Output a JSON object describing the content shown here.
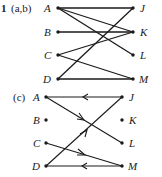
{
  "problem_number": "1",
  "diagram_ab": {
    "part_label": "(a,b)",
    "left_nodes": [
      "A",
      "B",
      "C",
      "D"
    ],
    "right_nodes": [
      "J",
      "K",
      "L",
      "M"
    ],
    "edges": [
      [
        "A",
        "J"
      ],
      [
        "A",
        "K"
      ],
      [
        "A",
        "L"
      ],
      [
        "B",
        "K"
      ],
      [
        "C",
        "K"
      ],
      [
        "C",
        "M"
      ],
      [
        "D",
        "J"
      ],
      [
        "D",
        "M"
      ]
    ]
  },
  "diagram_c": {
    "part_label": "(c)",
    "left_nodes": [
      "A",
      "B",
      "C",
      "D"
    ],
    "right_nodes": [
      "J",
      "K",
      "L",
      "M"
    ],
    "directed_edges": [
      [
        "J",
        "A"
      ],
      [
        "A",
        "L"
      ],
      [
        "D",
        "J"
      ],
      [
        "C",
        "M"
      ],
      [
        "M",
        "D"
      ]
    ],
    "isolated_nodes": [
      "B",
      "K"
    ]
  },
  "colors": {
    "ink": "#1a1a1a",
    "background": "#ffffff"
  }
}
